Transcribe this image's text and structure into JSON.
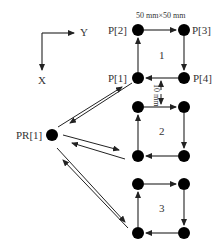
{
  "axes": {
    "y_label": "Y",
    "x_label": "X"
  },
  "dimension_label": "50 mm×50 mm",
  "gap_label": "10 mm",
  "points": {
    "p1": "P[1]",
    "p2": "P[2]",
    "p3": "P[3]",
    "p4": "P[4]",
    "pr1": "PR[1]"
  },
  "squares": [
    {
      "label": "1"
    },
    {
      "label": "2"
    },
    {
      "label": "3"
    }
  ]
}
